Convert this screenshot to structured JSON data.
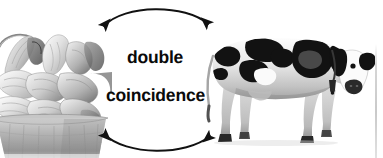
{
  "figure": {
    "caption_lines": [
      "double",
      "coincidence"
    ],
    "background_color": "#ffffff",
    "text_color": "#0a0a0a",
    "arrow_color": "#111111",
    "width_px": 383,
    "height_px": 158,
    "rendering": "grayscale photographic collage"
  },
  "labels": {
    "line1": "double",
    "line2": "coincidence"
  },
  "left_subject": {
    "name": "basket-of-corn",
    "alt": "woven basket overflowing with husked ears of corn",
    "tone": "grayscale"
  },
  "right_subject": {
    "name": "holstein-cow",
    "alt": "black and white Holstein dairy cow standing, facing right",
    "tone": "grayscale"
  },
  "arrows": [
    {
      "name": "top-arc-arrow",
      "direction": "bidirectional",
      "curve": "arc bulging upward",
      "from": "basket-of-corn",
      "to": "holstein-cow"
    },
    {
      "name": "bottom-arc-arrow",
      "direction": "bidirectional",
      "curve": "arc bulging downward",
      "from": "holstein-cow",
      "to": "basket-of-corn"
    }
  ],
  "decorations": {
    "right_edge_rule": "faint vertical gray rule at right margin"
  }
}
